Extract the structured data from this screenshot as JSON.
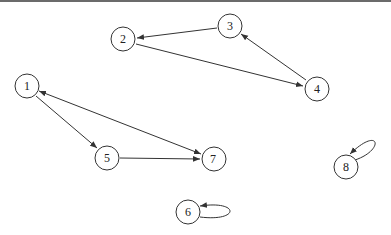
{
  "graph": {
    "title": "",
    "directed": true,
    "nodes": [
      {
        "id": "1",
        "label": "1",
        "x": 27,
        "y": 86
      },
      {
        "id": "2",
        "label": "2",
        "x": 123,
        "y": 39
      },
      {
        "id": "3",
        "label": "3",
        "x": 230,
        "y": 26
      },
      {
        "id": "4",
        "label": "4",
        "x": 317,
        "y": 89
      },
      {
        "id": "5",
        "label": "5",
        "x": 107,
        "y": 158
      },
      {
        "id": "6",
        "label": "6",
        "x": 188,
        "y": 212
      },
      {
        "id": "7",
        "label": "7",
        "x": 214,
        "y": 159
      },
      {
        "id": "8",
        "label": "8",
        "x": 346,
        "y": 167
      }
    ],
    "edges": [
      {
        "from": "3",
        "to": "2"
      },
      {
        "from": "2",
        "to": "4"
      },
      {
        "from": "4",
        "to": "3"
      },
      {
        "from": "1",
        "to": "5"
      },
      {
        "from": "5",
        "to": "7"
      },
      {
        "from": "1",
        "to": "7"
      },
      {
        "from": "7",
        "to": "1"
      },
      {
        "from": "6",
        "to": "6"
      },
      {
        "from": "8",
        "to": "8"
      }
    ]
  },
  "colors": {
    "stroke": "#333333",
    "background": "#ffffff",
    "topbar": "#6b6b6b"
  }
}
